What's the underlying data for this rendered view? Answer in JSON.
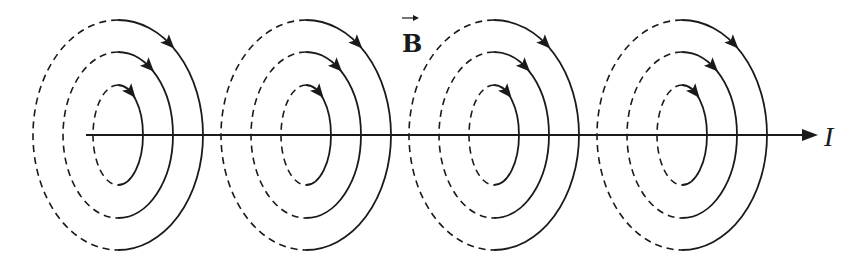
{
  "figure": {
    "labels": {
      "field": "B",
      "field_has_vector_arrow": true,
      "current": "I"
    },
    "colors": {
      "line": "#1a1a1a",
      "background": "#ffffff"
    },
    "wire": {
      "y": 135,
      "x_start": 86,
      "x_end": 818
    },
    "loop_groups": [
      {
        "cx": 118
      },
      {
        "cx": 306
      },
      {
        "cx": 494
      },
      {
        "cx": 682
      }
    ],
    "rings": [
      {
        "rx": 25,
        "ry": 50
      },
      {
        "rx": 55,
        "ry": 83
      },
      {
        "rx": 85,
        "ry": 115
      }
    ],
    "ring_style": {
      "back_half": "dashed",
      "front_half": "solid",
      "arrow_direction": "clockwise"
    }
  }
}
